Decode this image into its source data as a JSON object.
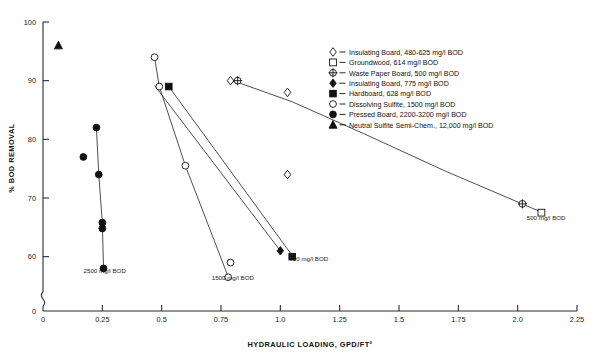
{
  "chart_data": {
    "type": "scatter",
    "title": "",
    "xlabel": "HYDRAULIC LOADING, GPD/FT²",
    "ylabel": "% BOD REMOVAL",
    "xlim": [
      0,
      2.25
    ],
    "ylim": [
      55,
      100
    ],
    "y_axis_break": true,
    "y_break_label": "0",
    "grid": false,
    "xticks": [
      "0",
      "0.25",
      "0.5",
      "0.75",
      "1.0",
      "1.25",
      "1.5",
      "1.75",
      "2.0",
      "2.25"
    ],
    "xtick_values": [
      0,
      0.25,
      0.5,
      0.75,
      1.0,
      1.25,
      1.5,
      1.75,
      2.0,
      2.25
    ],
    "yticks": [
      "0",
      "60",
      "70",
      "80",
      "90",
      "100"
    ],
    "ytick_values": [
      0,
      60,
      70,
      80,
      90,
      100
    ],
    "legend_position": "upper-right",
    "legend": [
      {
        "marker": "open-diamond",
        "label": "Insulating Board, 480-625 mg/l BOD"
      },
      {
        "marker": "open-square",
        "label": "Groundwood, 614 mg/l BOD"
      },
      {
        "marker": "crossed-circle",
        "label": "Waste Paper Board, 500 mg/l BOD"
      },
      {
        "marker": "filled-diamond",
        "label": "Insulating Board, 775 mg/l BOD"
      },
      {
        "marker": "filled-square",
        "label": "Hardboard, 628 mg/l BOD"
      },
      {
        "marker": "open-circle",
        "label": "Dissolving Sulfite, 1500 mg/l BOD"
      },
      {
        "marker": "filled-circle",
        "label": "Pressed Board, 2200-3200 mg/l BOD"
      },
      {
        "marker": "filled-triangle",
        "label": "Neutral Sulfite Semi-Chem., 12,000 mg/l BOD"
      }
    ],
    "series": [
      {
        "name": "Insulating Board, 480-625 mg/l BOD",
        "marker": "open-diamond",
        "points": [
          [
            0.79,
            90.0
          ],
          [
            1.03,
            88.0
          ],
          [
            1.03,
            74.0
          ]
        ]
      },
      {
        "name": "Groundwood, 614 mg/l BOD",
        "marker": "open-square",
        "points": [
          [
            2.1,
            67.5
          ]
        ]
      },
      {
        "name": "Waste Paper Board, 500 mg/l BOD",
        "marker": "crossed-circle",
        "points": [
          [
            0.82,
            90.0
          ],
          [
            2.02,
            69.0
          ]
        ]
      },
      {
        "name": "Insulating Board, 775 mg/l BOD",
        "marker": "filled-diamond",
        "points": [
          [
            1.0,
            61.0
          ]
        ]
      },
      {
        "name": "Hardboard, 628 mg/l BOD",
        "marker": "filled-square",
        "points": [
          [
            0.53,
            89.0
          ],
          [
            1.05,
            60.0
          ]
        ]
      },
      {
        "name": "Dissolving Sulfite, 1500 mg/l BOD",
        "marker": "open-circle",
        "points": [
          [
            0.47,
            94.0
          ],
          [
            0.49,
            89.0
          ],
          [
            0.6,
            75.5
          ],
          [
            0.79,
            59.0
          ],
          [
            0.78,
            56.5
          ]
        ]
      },
      {
        "name": "Pressed Board, 2200-3200 mg/l BOD",
        "marker": "filled-circle",
        "points": [
          [
            0.225,
            82.0
          ],
          [
            0.17,
            77.0
          ],
          [
            0.235,
            74.0
          ],
          [
            0.25,
            65.8
          ],
          [
            0.25,
            64.8
          ],
          [
            0.255,
            58.0
          ]
        ]
      },
      {
        "name": "Neutral Sulfite Semi-Chem., 12,000 mg/l BOD",
        "marker": "filled-triangle",
        "points": [
          [
            0.065,
            96.0
          ]
        ]
      }
    ],
    "trend_lines": [
      {
        "name": "waste-paper-curve",
        "path": [
          [
            0.8,
            90.0
          ],
          [
            1.05,
            86.4
          ],
          [
            1.35,
            81.0
          ],
          [
            1.7,
            74.5
          ],
          [
            2.1,
            67.6
          ]
        ]
      },
      {
        "name": "hardboard-line",
        "path": [
          [
            0.53,
            89.0
          ],
          [
            1.05,
            60.2
          ]
        ]
      },
      {
        "name": "dissolving-curve",
        "path": [
          [
            0.47,
            94.0
          ],
          [
            0.49,
            89.0
          ],
          [
            0.6,
            75.5
          ],
          [
            0.78,
            56.6
          ]
        ]
      },
      {
        "name": "insulating-line",
        "path": [
          [
            0.47,
            89.2
          ],
          [
            1.0,
            61.0
          ]
        ]
      },
      {
        "name": "pressed-line",
        "path": [
          [
            0.225,
            82.0
          ],
          [
            0.235,
            74.0
          ],
          [
            0.25,
            65.8
          ],
          [
            0.255,
            58.0
          ]
        ]
      }
    ],
    "annotations": [
      {
        "text": "2500 mg/l BOD",
        "x": 0.26,
        "y": 57.2,
        "anchor": "middle"
      },
      {
        "text": "1500 mg/l BOD",
        "x": 0.8,
        "y": 56.0,
        "anchor": "middle"
      },
      {
        "text": "700 mg/l BOD",
        "x": 1.12,
        "y": 59.2,
        "anchor": "middle"
      },
      {
        "text": "500 mg/l BOD",
        "x": 2.12,
        "y": 66.3,
        "anchor": "middle"
      }
    ]
  },
  "colors": {
    "axis": "#2b2b2b",
    "marker": "#111111",
    "line": "#3a3a3a",
    "background": "#ffffff"
  }
}
